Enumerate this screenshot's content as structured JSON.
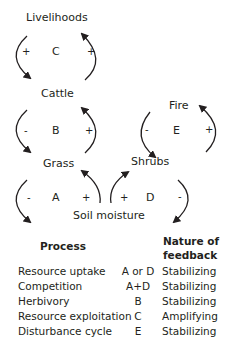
{
  "diagram": {
    "nodes": {
      "livelihoods": "Livelihoods",
      "cattle": "Cattle",
      "grass": "Grass",
      "fire": "Fire",
      "shrubs": "Shrubs",
      "soil_moisture": "Soil moisture"
    },
    "loops": [
      {
        "id": "C",
        "left_sign": "+",
        "right_sign": "+"
      },
      {
        "id": "B",
        "left_sign": "-",
        "right_sign": "+"
      },
      {
        "id": "A",
        "left_sign": "-",
        "right_sign": "+"
      },
      {
        "id": "E",
        "left_sign": "-",
        "right_sign": "+"
      },
      {
        "id": "D",
        "left_sign": "+",
        "right_sign": "-"
      }
    ],
    "stroke_color": "#231f20"
  },
  "table": {
    "headers": {
      "process": "Process",
      "feedback_line1": "Nature of",
      "feedback_line2": "feedback"
    },
    "rows": [
      {
        "process": "Resource uptake",
        "loop": "A or D",
        "feedback": "Stabilizing"
      },
      {
        "process": "Competition",
        "loop": "A+D",
        "feedback": "Stabilizing"
      },
      {
        "process": "Herbivory",
        "loop": "B",
        "feedback": "Stabilizing"
      },
      {
        "process": "Resource exploitation",
        "loop": "C",
        "feedback": "Amplifying"
      },
      {
        "process": "Disturbance cycle",
        "loop": "E",
        "feedback": "Stabilizing"
      }
    ]
  }
}
